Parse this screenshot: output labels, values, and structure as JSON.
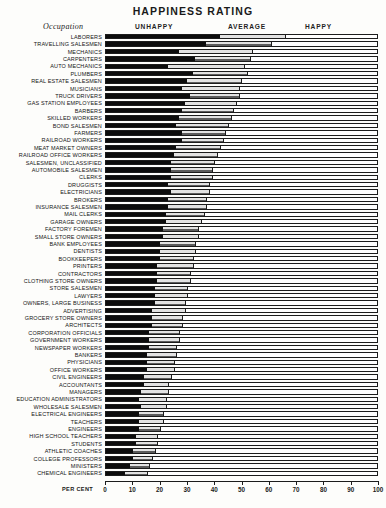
{
  "title": "HAPPINESS RATING",
  "occupation_header": "Occupation",
  "percent_label": "PER CENT",
  "segment_headers": {
    "unhappy": "UNHAPPY",
    "average": "AVERAGE",
    "happy": "HAPPY"
  },
  "colors": {
    "unhappy": "#0c0c0c",
    "average": "#8e8e8e",
    "happy": "#ffffff",
    "outline": "#1c1c1c"
  },
  "chart_data": {
    "type": "bar",
    "title": "HAPPINESS RATING",
    "xlabel": "PER CENT",
    "ylabel": "Occupation",
    "xlim": [
      0,
      100
    ],
    "grid": false,
    "legend_position": "top",
    "orientation": "horizontal",
    "stacked": true,
    "ticks": [
      0,
      10,
      20,
      30,
      40,
      50,
      60,
      70,
      80,
      90,
      100
    ],
    "series": [
      {
        "name": "UNHAPPY",
        "color": "#0c0c0c"
      },
      {
        "name": "AVERAGE",
        "color": "#8e8e8e"
      },
      {
        "name": "HAPPY",
        "color": "#ffffff"
      }
    ],
    "categories": [
      "LABORERS",
      "TRAVELLING SALESMEN",
      "MECHANICS",
      "CARPENTERS",
      "AUTO MECHANICS",
      "PLUMBERS",
      "REAL ESTATE SALESMEN",
      "MUSICIANS",
      "TRUCK DRIVERS",
      "GAS STATION EMPLOYEES",
      "BARBERS",
      "SKILLED WORKERS",
      "BOND SALESMEN",
      "FARMERS",
      "RAILROAD WORKERS",
      "MEAT MARKET OWNERS",
      "RAILROAD OFFICE WORKERS",
      "SALESMEN, UNCLASSIFIED",
      "AUTOMOBILE SALESMEN",
      "CLERKS",
      "DRUGGISTS",
      "ELECTRICIANS",
      "BROKERS",
      "INSURANCE SALESMEN",
      "MAIL CLERKS",
      "GARAGE OWNERS",
      "FACTORY FOREMEN",
      "SMALL STORE OWNERS",
      "BANK EMPLOYEES",
      "DENTISTS",
      "BOOKKEEPERS",
      "PRINTERS",
      "CONTRACTORS",
      "CLOTHING STORE OWNERS",
      "STORE SALESMEN",
      "LAWYERS",
      "OWNERS, LARGE BUSINESS",
      "ADVERTISING",
      "GROCERY STORE OWNERS",
      "ARCHITECTS",
      "CORPORATION OFFICIALS",
      "GOVERNMENT WORKERS",
      "NEWSPAPER WORKERS",
      "BANKERS",
      "PHYSICIANS",
      "OFFICE WORKERS",
      "CIVIL ENGINEERS",
      "ACCOUNTANTS",
      "MANAGERS",
      "EDUCATION ADMINISTRATORS",
      "WHOLESALE SALESMEN",
      "ELECTRICAL ENGINEERS",
      "TEACHERS",
      "ENGINEERS",
      "HIGH SCHOOL TEACHERS",
      "STUDENTS",
      "ATHLETIC COACHES",
      "COLLEGE PROFESSORS",
      "MINISTERS",
      "CHEMICAL ENGINEERS"
    ],
    "unhappy": [
      42,
      37,
      27,
      33,
      23,
      32,
      30,
      28,
      31,
      29,
      28,
      27,
      26,
      28,
      28,
      26,
      25,
      24,
      24,
      24,
      23,
      24,
      23,
      23,
      22,
      22,
      21,
      21,
      20,
      20,
      20,
      19,
      19,
      19,
      18,
      18,
      18,
      17,
      17,
      17,
      16,
      16,
      16,
      15,
      15,
      15,
      14,
      14,
      13,
      12,
      13,
      12,
      12,
      12,
      11,
      11,
      10,
      10,
      9,
      7
    ],
    "average": [
      24,
      24,
      27,
      20,
      28,
      20,
      20,
      21,
      18,
      19,
      19,
      19,
      19,
      16,
      15,
      16,
      16,
      16,
      15,
      15,
      15,
      14,
      14,
      14,
      14,
      13,
      13,
      13,
      13,
      13,
      12,
      13,
      12,
      12,
      12,
      12,
      11,
      12,
      11,
      11,
      11,
      11,
      10,
      11,
      10,
      10,
      10,
      9,
      10,
      10,
      9,
      9,
      9,
      8,
      8,
      8,
      8,
      7,
      7,
      8
    ],
    "happy": [
      34,
      39,
      46,
      47,
      49,
      48,
      50,
      51,
      51,
      52,
      53,
      54,
      55,
      56,
      57,
      58,
      59,
      60,
      61,
      61,
      62,
      62,
      63,
      63,
      64,
      65,
      66,
      66,
      67,
      67,
      68,
      68,
      69,
      69,
      70,
      70,
      71,
      71,
      72,
      72,
      73,
      73,
      74,
      74,
      75,
      75,
      76,
      77,
      77,
      78,
      78,
      79,
      79,
      80,
      81,
      81,
      82,
      83,
      84,
      85
    ]
  }
}
